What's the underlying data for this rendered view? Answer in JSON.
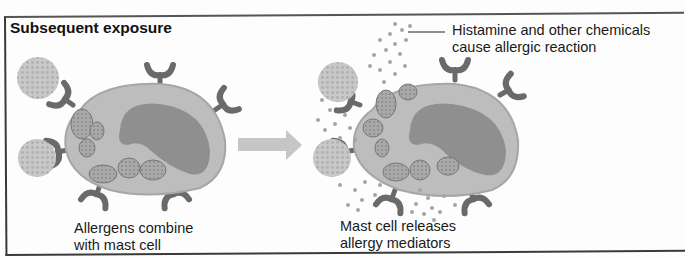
{
  "figure": {
    "title": "Subsequent exposure",
    "panels": [
      {
        "id": "before",
        "caption_line1": "Allergens combine",
        "caption_line2": "with mast cell"
      },
      {
        "id": "after",
        "caption_line1": "Mast cell releases",
        "caption_line2": "allergy mediators",
        "callout_line1": "Histamine and other chemicals",
        "callout_line2": "cause allergic reaction"
      }
    ],
    "arrow": "right-arrow",
    "colors": {
      "cell_body": "#b9b9b9",
      "nucleus": "#8e8e8e",
      "receptor": "#6a6a6a",
      "allergen": "#c4c4c4",
      "granule_dots": "#a8a8a8",
      "arrow": "#c6c6c6"
    }
  }
}
